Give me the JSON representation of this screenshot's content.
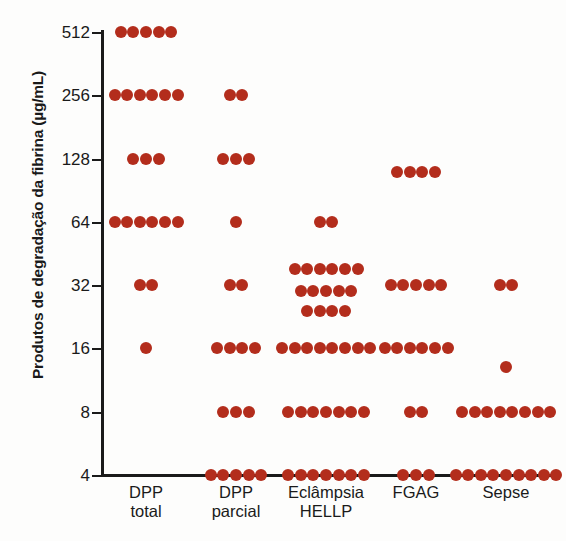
{
  "chart_data": {
    "type": "scatter",
    "title": "",
    "xlabel": "",
    "ylabel": "Produtos de degradação da fibrina (µg/mL)",
    "yscale": "log2",
    "yticks": [
      4,
      8,
      16,
      32,
      64,
      128,
      256,
      512
    ],
    "yticklabels": [
      "4",
      "8",
      "16",
      "32",
      "64",
      "128",
      "256",
      "512"
    ],
    "ylim": [
      4,
      512
    ],
    "grid": false,
    "legend": false,
    "marker_color": "#b32d1c",
    "categories": [
      "DPP total",
      "DPP parcial",
      "Eclâmpsia HELLP",
      "FGAG",
      "Sepse"
    ],
    "category_lines": [
      [
        "DPP",
        "total"
      ],
      [
        "DPP",
        "parcial"
      ],
      [
        "Eclâmpsia",
        "HELLP"
      ],
      [
        "FGAG",
        ""
      ],
      [
        "Sepse",
        ""
      ]
    ],
    "series": [
      {
        "name": "DPP total",
        "groups": [
          {
            "value": 512,
            "count": 5
          },
          {
            "value": 256,
            "count": 6
          },
          {
            "value": 128,
            "count": 3
          },
          {
            "value": 64,
            "count": 6
          },
          {
            "value": 32,
            "count": 2
          },
          {
            "value": 16,
            "count": 1
          }
        ],
        "n": 23
      },
      {
        "name": "DPP parcial",
        "groups": [
          {
            "value": 256,
            "count": 2
          },
          {
            "value": 128,
            "count": 3
          },
          {
            "value": 64,
            "count": 1
          },
          {
            "value": 32,
            "count": 2
          },
          {
            "value": 16,
            "count": 4
          },
          {
            "value": 8,
            "count": 3
          },
          {
            "value": 4,
            "count": 5
          }
        ],
        "n": 20
      },
      {
        "name": "Eclâmpsia HELLP",
        "groups": [
          {
            "value": 64,
            "count": 2
          },
          {
            "value": 38,
            "count": 6
          },
          {
            "value": 30,
            "count": 5
          },
          {
            "value": 24,
            "count": 4
          },
          {
            "value": 16,
            "count": 8
          },
          {
            "value": 8,
            "count": 7
          },
          {
            "value": 4,
            "count": 7
          }
        ],
        "n": 39
      },
      {
        "name": "FGAG",
        "groups": [
          {
            "value": 110,
            "count": 4
          },
          {
            "value": 32,
            "count": 5
          },
          {
            "value": 16,
            "count": 6
          },
          {
            "value": 8,
            "count": 2
          },
          {
            "value": 4,
            "count": 3
          }
        ],
        "n": 20
      },
      {
        "name": "Sepse",
        "groups": [
          {
            "value": 32,
            "count": 2
          },
          {
            "value": 13,
            "count": 1
          },
          {
            "value": 8,
            "count": 8
          },
          {
            "value": 4,
            "count": 9
          }
        ],
        "n": 20
      }
    ]
  }
}
